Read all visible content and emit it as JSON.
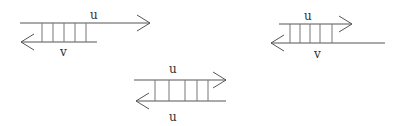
{
  "diagrams": [
    {
      "id": "left",
      "top_label": "u",
      "bottom_label": "v",
      "top_strand": {
        "direction": "right"
      },
      "bottom_strand": {
        "direction": "left"
      },
      "rungs": 5
    },
    {
      "id": "right",
      "top_label": "u",
      "bottom_label": "v",
      "top_strand": {
        "direction": "right"
      },
      "bottom_strand": {
        "direction": "left"
      },
      "rungs": 5
    },
    {
      "id": "middle",
      "top_label": "u",
      "bottom_label": "u",
      "top_strand": {
        "direction": "right"
      },
      "bottom_strand": {
        "direction": "left"
      },
      "rungs": 5
    }
  ],
  "colors": {
    "line": "#555555",
    "rung": "#777777",
    "text": "#333333",
    "background": "#ffffff"
  }
}
